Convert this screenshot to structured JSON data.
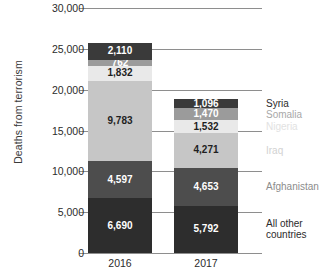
{
  "chart_data": {
    "type": "bar",
    "subtype": "stacked",
    "title": "",
    "xlabel": "",
    "ylabel": "Deaths from terrorism",
    "categories": [
      "2016",
      "2017"
    ],
    "ylim": [
      0,
      30000
    ],
    "yticks": [
      0,
      5000,
      10000,
      15000,
      20000,
      25000,
      30000
    ],
    "ytick_labels": [
      "0",
      "5,000",
      "10,000",
      "15,000",
      "20,000",
      "25,000",
      "30,000"
    ],
    "grid": true,
    "legend_position": "right",
    "stack_order_bottom_to_top": [
      "All other countries",
      "Afghanistan",
      "Iraq",
      "Nigeria",
      "Somalia",
      "Syria"
    ],
    "series": [
      {
        "name": "All other countries",
        "color": "#2d2d2d",
        "text_color": "#ffffff",
        "legend_color": "#2b2b2b",
        "values": [
          6690,
          5792
        ],
        "labels": [
          "6,690",
          "5,792"
        ]
      },
      {
        "name": "Afghanistan",
        "color": "#4d4d4d",
        "text_color": "#ffffff",
        "legend_color": "#8c8c8c",
        "values": [
          4597,
          4653
        ],
        "labels": [
          "4,597",
          "4,653"
        ]
      },
      {
        "name": "Iraq",
        "color": "#c6c6c6",
        "text_color": "#1f1f1f",
        "legend_color": "#d2d2d2",
        "values": [
          9783,
          4271
        ],
        "labels": [
          "9,783",
          "4,271"
        ]
      },
      {
        "name": "Nigeria",
        "color": "#e9e9e9",
        "text_color": "#1f1f1f",
        "legend_color": "#e2e2e2",
        "values": [
          1832,
          1532
        ],
        "labels": [
          "1,832",
          "1,532"
        ]
      },
      {
        "name": "Somalia",
        "color": "#9b9b9b",
        "text_color": "#ffffff",
        "legend_color": "#a8a8a8",
        "values": [
          762,
          1470
        ],
        "labels": [
          "762",
          "1,470"
        ]
      },
      {
        "name": "Syria",
        "color": "#3a3a3a",
        "text_color": "#ffffff",
        "legend_color": "#2b2b2b",
        "values": [
          2110,
          1096
        ],
        "labels": [
          "2,110",
          "1,096"
        ]
      }
    ],
    "totals": [
      25774,
      18814
    ],
    "legend_entries": [
      {
        "label": "Syria"
      },
      {
        "label": "Somalia"
      },
      {
        "label": "Nigeria"
      },
      {
        "label": "Iraq"
      },
      {
        "label": "Afghanistan"
      },
      {
        "label": "All other countries"
      }
    ]
  }
}
